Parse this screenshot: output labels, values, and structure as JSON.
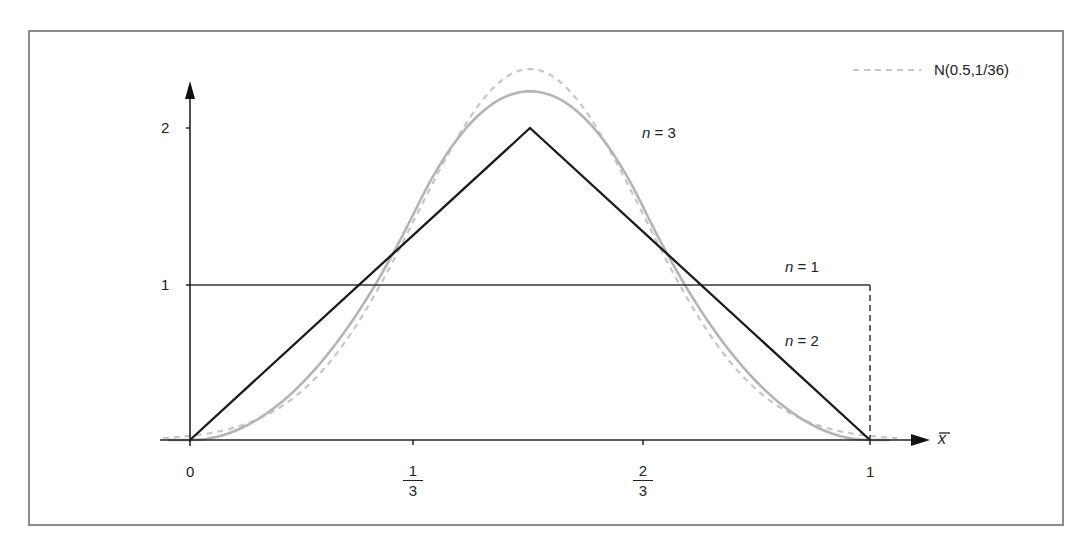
{
  "chart_data": {
    "type": "line",
    "title": "",
    "xlabel": "x̄",
    "ylabel": "",
    "xlim": [
      0,
      1.07
    ],
    "ylim": [
      0,
      2.55
    ],
    "grid": false,
    "legend_position": "top-right",
    "x_ticks": [
      {
        "value": 0,
        "label": "0"
      },
      {
        "value": 0.3333,
        "label_num": "1",
        "label_den": "3"
      },
      {
        "value": 0.6667,
        "label_num": "2",
        "label_den": "3"
      },
      {
        "value": 1,
        "label": "1"
      }
    ],
    "y_ticks": [
      {
        "value": 1,
        "label": "1"
      },
      {
        "value": 2,
        "label": "2"
      }
    ],
    "series": [
      {
        "name": "n = 1",
        "style": "solid-black-thin",
        "color": "#222222",
        "x": [
          0,
          0,
          1,
          1
        ],
        "y": [
          0,
          1,
          1,
          0
        ],
        "note": "uniform density on [0,1]; right edge drawn dashed"
      },
      {
        "name": "n = 2",
        "style": "solid-black",
        "color": "#1a1a1a",
        "x": [
          0,
          0.5,
          1
        ],
        "y": [
          0,
          2,
          0
        ]
      },
      {
        "name": "n = 3",
        "style": "solid-gray",
        "color": "#b4b4b4",
        "x": [
          0,
          0.1,
          0.2,
          0.3333,
          0.4,
          0.5,
          0.6,
          0.6667,
          0.8,
          0.9,
          1
        ],
        "y": [
          0,
          0.135,
          0.54,
          1.5,
          1.98,
          2.25,
          1.98,
          1.5,
          0.54,
          0.135,
          0
        ]
      },
      {
        "name": "N(0.5,1/36)",
        "style": "dashed-gray",
        "color": "#c4c4c4",
        "x": [
          0,
          0.1,
          0.2,
          0.3,
          0.3333,
          0.4,
          0.5,
          0.6,
          0.6667,
          0.7,
          0.8,
          0.9,
          1
        ],
        "y": [
          0.027,
          0.133,
          0.47,
          1.16,
          1.45,
          2.02,
          2.39,
          2.02,
          1.45,
          1.16,
          0.47,
          0.133,
          0.027
        ]
      }
    ],
    "annotations": [
      {
        "text": "n = 3",
        "near_x": 0.72,
        "near_y": 1.95
      },
      {
        "text": "n = 1",
        "near_x": 0.9,
        "near_y": 1.1
      },
      {
        "text": "n = 2",
        "near_x": 0.9,
        "near_y": 0.6
      }
    ]
  },
  "legend": {
    "items": [
      {
        "label": "N(0.5,1/36)",
        "style": "dashed-gray"
      }
    ]
  },
  "axis": {
    "x_symbol": "x",
    "y_tick_1": "1",
    "y_tick_2": "2",
    "x_tick_0": "0",
    "x_tick_1": "1",
    "x_tick_third_num": "1",
    "x_tick_third_den": "3",
    "x_tick_twothird_num": "2",
    "x_tick_twothird_den": "3"
  },
  "annotations": {
    "n3_var": "n",
    "n3_rest": " = 3",
    "n1_var": "n",
    "n1_rest": " = 1",
    "n2_var": "n",
    "n2_rest": " = 2"
  }
}
